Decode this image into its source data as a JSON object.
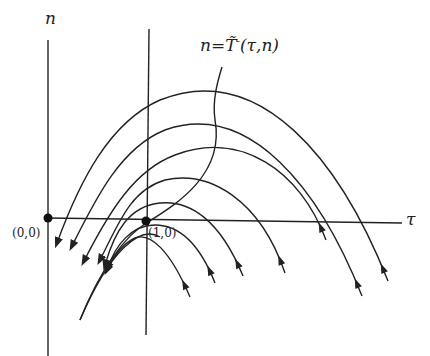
{
  "diagram": {
    "axes": {
      "vertical_label": "n",
      "horizontal_label": "τ",
      "origin_label": "(0,0)",
      "point_label": "(1,0)"
    },
    "curve_label": {
      "lhs": "n",
      "eq": "=",
      "T": "T̃",
      "sup": "-",
      "args": "(τ,n)"
    },
    "colors": {
      "stroke": "#222222",
      "background": "#ffffff"
    },
    "trajectories": [
      {
        "d": "M 388 281 C 340 160, 260 60, 160 100 C 110 122, 80 180, 57 243",
        "arrow_mid": [
          388,
          281
        ],
        "arrow_end": [
          57,
          243
        ]
      },
      {
        "d": "M 362 296 C 320 190, 250 100, 165 130 C 120 148, 95 200, 72 246",
        "arrow_mid": [
          362,
          296
        ],
        "arrow_end": [
          72,
          246
        ]
      },
      {
        "d": "M 326 240 C 300 170, 240 130, 175 155 C 135 170, 110 210, 84 261",
        "arrow_mid": [
          326,
          240
        ],
        "arrow_end": [
          84,
          261
        ]
      },
      {
        "d": "M 285 273 C 260 200, 210 170, 165 180 C 130 190, 118 225, 100 260",
        "arrow_mid": [
          285,
          273
        ],
        "arrow_end": [
          100,
          260
        ]
      },
      {
        "d": "M 243 276 C 220 220, 190 200, 160 203 C 130 206, 115 230, 105 265",
        "arrow_mid": [
          243,
          276
        ],
        "arrow_end": [
          105,
          265
        ]
      },
      {
        "d": "M 215 283 C 200 245, 180 225, 155 225 C 132 225, 115 245, 108 268",
        "arrow_mid": [
          215,
          283
        ],
        "arrow_end": [
          108,
          268
        ]
      },
      {
        "d": "M 190 297 C 170 250, 150 232, 135 238 C 122 244, 114 255, 107 270",
        "arrow_mid": [
          190,
          297
        ],
        "arrow_end": [
          107,
          270
        ]
      }
    ],
    "separatrix": "M 80 320 C 100 270, 125 235, 148 222 C 175 205, 225 175, 215 120 C 212 100, 218 80, 222 67",
    "lower_parabola": "M 80 320 C 110 250, 140 225, 160 237"
  }
}
